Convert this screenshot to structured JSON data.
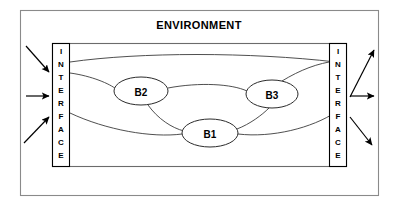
{
  "diagram": {
    "title": "ENVIRONMENT",
    "environment_box": {
      "label": "environment-boundary"
    },
    "system_box": {
      "label": "system-boundary"
    },
    "interfaces": [
      {
        "id": "left",
        "label": "INTERFACE",
        "letters": [
          "I",
          "N",
          "T",
          "E",
          "R",
          "F",
          "A",
          "C",
          "E"
        ]
      },
      {
        "id": "right",
        "label": "INTERFACE",
        "letters": [
          "I",
          "N",
          "T",
          "E",
          "R",
          "F",
          "A",
          "C",
          "E"
        ]
      }
    ],
    "nodes": [
      {
        "id": "B1",
        "label": "B1",
        "cx": 210,
        "cy": 133,
        "rx": 28,
        "ry": 14
      },
      {
        "id": "B2",
        "label": "B2",
        "cx": 141,
        "cy": 91,
        "rx": 27,
        "ry": 14
      },
      {
        "id": "B3",
        "label": "B3",
        "cx": 272,
        "cy": 94,
        "rx": 26,
        "ry": 14
      }
    ],
    "connections": [
      {
        "from": "left-interface",
        "to": "right-interface",
        "kind": "curve-upper"
      },
      {
        "from": "left-interface",
        "to": "B2",
        "kind": "curve"
      },
      {
        "from": "B2",
        "to": "B3",
        "kind": "curve"
      },
      {
        "from": "B3",
        "to": "right-interface",
        "kind": "curve"
      },
      {
        "from": "left-interface",
        "to": "B1",
        "kind": "curve-lower"
      },
      {
        "from": "B1",
        "to": "right-interface",
        "kind": "curve-lower"
      },
      {
        "from": "B2",
        "to": "B1",
        "kind": "curve"
      },
      {
        "from": "B1",
        "to": "B3",
        "kind": "curve"
      }
    ],
    "inputs": [
      {
        "id": "in-1",
        "direction": "diagonal-down-right"
      },
      {
        "id": "in-2",
        "direction": "horizontal-right"
      },
      {
        "id": "in-3",
        "direction": "diagonal-up-right"
      }
    ],
    "outputs": [
      {
        "id": "out-1",
        "direction": "diagonal-up-right"
      },
      {
        "id": "out-2",
        "direction": "horizontal-right"
      },
      {
        "id": "out-3",
        "direction": "diagonal-down-right"
      }
    ],
    "colors": {
      "background": "#ffffff",
      "stroke": "#000000",
      "frame": "#8a8a8a",
      "link": "#3b3b3b"
    }
  }
}
